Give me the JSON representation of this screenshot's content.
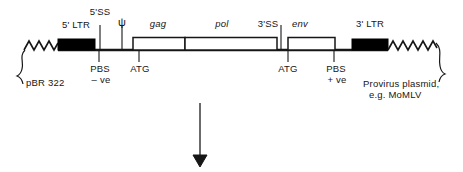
{
  "figure": {
    "colors": {
      "line": "#161616",
      "filled_box": "#000000",
      "open_box_fill": "#ffffff",
      "text": "#161616",
      "background": "#ffffff"
    },
    "top_labels": [
      {
        "id": "five-ss",
        "text": "5'SS",
        "x": 100,
        "y": 8,
        "style": "plain"
      },
      {
        "id": "five-ltr",
        "text": "5' LTR",
        "x": 76,
        "y": 20,
        "style": "plain"
      },
      {
        "id": "psi",
        "text": "ψ",
        "x": 122,
        "y": 19,
        "style": "plain"
      },
      {
        "id": "gag",
        "text": "gag",
        "x": 158,
        "y": 19,
        "style": "italic"
      },
      {
        "id": "pol",
        "text": "pol",
        "x": 222,
        "y": 19,
        "style": "italic"
      },
      {
        "id": "three-ss",
        "text": "3'SS",
        "x": 268,
        "y": 19,
        "style": "plain"
      },
      {
        "id": "env",
        "text": "env",
        "x": 300,
        "y": 19,
        "style": "italic"
      },
      {
        "id": "three-ltr",
        "text": "3' LTR",
        "x": 370,
        "y": 19,
        "style": "plain"
      }
    ],
    "bottom_labels": [
      {
        "id": "pbs-minus",
        "line1": "PBS",
        "line2": "– ve",
        "x": 99,
        "y": 64
      },
      {
        "id": "atg-left",
        "line1": "ATG",
        "line2": "",
        "x": 139,
        "y": 64
      },
      {
        "id": "atg-right",
        "line1": "ATG",
        "line2": "",
        "x": 288,
        "y": 64
      },
      {
        "id": "pbs-plus",
        "line1": "PBS",
        "line2": "+ ve",
        "x": 334,
        "y": 64
      }
    ],
    "bracket_labels": [
      {
        "id": "pbr322",
        "text": "pBR 322",
        "x": 22,
        "y": 78
      }
    ],
    "plasmid_caption": {
      "id": "provirus-plasmid-caption",
      "line1": "Provirus plasmid,",
      "line2": "e.g. MoMLV",
      "x": 364,
      "y": 77
    },
    "segments": {
      "ltr5": {
        "label": "5' LTR",
        "x": 58,
        "width": 37,
        "filled": true
      },
      "gag": {
        "label": "gag",
        "x": 133,
        "width": 52,
        "filled": false
      },
      "pol": {
        "label": "pol",
        "x": 185,
        "width": 92,
        "filled": false
      },
      "env": {
        "label": "env",
        "x": 288,
        "width": 47,
        "filled": false
      },
      "ltr3": {
        "label": "3' LTR",
        "x": 352,
        "width": 36,
        "filled": true
      }
    },
    "tick_marks_top": [
      {
        "id": "tick-5ss",
        "x": 100
      },
      {
        "id": "tick-psi",
        "x": 122
      },
      {
        "id": "tick-3ss",
        "x": 281
      }
    ],
    "tick_marks_bottom": [
      {
        "id": "tick-pbs-minus",
        "x": 99
      },
      {
        "id": "tick-atg-left",
        "x": 139
      },
      {
        "id": "tick-atg-right",
        "x": 288
      },
      {
        "id": "tick-pbs-plus",
        "x": 334
      }
    ],
    "arrow": {
      "id": "process-arrow",
      "x": 200,
      "y_start": 103,
      "y_end": 166
    },
    "backbone_y": 50,
    "squiggle_left": {
      "x_start": 24,
      "x_end": 58
    },
    "squiggle_right": {
      "x_start": 388,
      "x_end": 437
    }
  }
}
